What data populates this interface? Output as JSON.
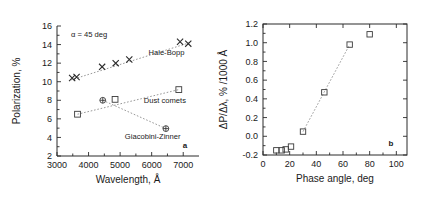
{
  "figure": {
    "panel_a_label": "a",
    "panel_b_label": "b"
  },
  "chart_data": [
    {
      "type": "scatter",
      "panel": "a",
      "title": "",
      "xlabel": "Wavelength, Å",
      "ylabel": "Polarization, %",
      "xlim": [
        3000,
        7500
      ],
      "ylim": [
        2,
        16
      ],
      "xticks": [
        3000,
        4000,
        5000,
        6000,
        7000
      ],
      "yticks": [
        2,
        4,
        6,
        8,
        10,
        12,
        14,
        16
      ],
      "xticklabels": [
        "3000",
        "4000",
        "5000",
        "6000",
        "7000"
      ],
      "yticklabels": [
        "2",
        "4",
        "6",
        "8",
        "10",
        "12",
        "14",
        "16"
      ],
      "grid": false,
      "legend": "inline-annotations",
      "annotation": "α = 45 deg",
      "series": [
        {
          "name": "Hale-Bopp",
          "marker": "x",
          "label": "Hale-Bopp",
          "x": [
            3480,
            3620,
            4430,
            4860,
            5290,
            6900,
            7160
          ],
          "y": [
            10.4,
            10.5,
            11.6,
            12.0,
            12.4,
            14.3,
            14.1
          ],
          "fit_line": [
            [
              3450,
              10.2
            ],
            [
              7200,
              14.2
            ]
          ]
        },
        {
          "name": "Dust comets",
          "marker": "square",
          "label": "Dust comets",
          "x": [
            3650,
            4840,
            6860
          ],
          "y": [
            6.5,
            8.1,
            9.15
          ],
          "fit_line": [
            [
              3650,
              6.5
            ],
            [
              6860,
              9.15
            ]
          ]
        },
        {
          "name": "Giacobini-Zinner",
          "marker": "circle-plus",
          "label": "Giacobini-Zinner",
          "x": [
            4450,
            6450
          ],
          "y": [
            8.0,
            4.95
          ],
          "fit_line": [
            [
              4450,
              8.0
            ],
            [
              6450,
              4.95
            ]
          ]
        }
      ]
    },
    {
      "type": "scatter",
      "panel": "b",
      "title": "",
      "xlabel": "Phase angle, deg",
      "ylabel": "ΔP/Δλ, % /1000 Å",
      "xlim": [
        0,
        108
      ],
      "ylim": [
        -0.2,
        1.2
      ],
      "xticks": [
        0,
        20,
        40,
        60,
        80,
        100
      ],
      "yticks": [
        -0.2,
        0.0,
        0.2,
        0.4,
        0.6,
        0.8,
        1.0,
        1.2
      ],
      "xticklabels": [
        "0",
        "20",
        "40",
        "60",
        "80",
        "100"
      ],
      "yticklabels": [
        "-0.2",
        "0.0",
        "0.2",
        "0.4",
        "0.6",
        "0.8",
        "1.0",
        "1.2"
      ],
      "grid": false,
      "legend": "none",
      "series": [
        {
          "name": "Spectral gradient vs phase angle",
          "marker": "square",
          "label": "",
          "x": [
            10,
            14,
            17,
            21,
            30,
            46,
            65,
            80
          ],
          "y": [
            -0.15,
            -0.15,
            -0.14,
            -0.11,
            0.05,
            0.47,
            0.98,
            1.09
          ],
          "fit_line": [
            [
              30,
              0.05
            ],
            [
              65,
              0.98
            ]
          ]
        }
      ]
    }
  ]
}
